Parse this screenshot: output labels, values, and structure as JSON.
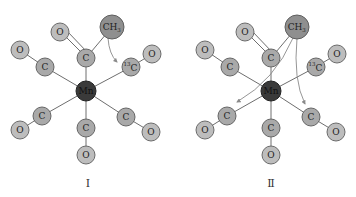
{
  "structures": [
    {
      "id": "I",
      "label": "Ⅰ",
      "metal": "Mn",
      "acyl_carbon": "C",
      "acyl_oxygen": "O",
      "methyl": "CH",
      "methyl_sub": "3",
      "isotope_carbon": "C",
      "isotope_mass": "13",
      "ligand_carbon": "C",
      "ligand_oxygen": "O",
      "arrows": [
        "CH3 migration to 13C"
      ]
    },
    {
      "id": "II",
      "label": "Ⅱ",
      "metal": "Mn",
      "acyl_carbon": "C",
      "acyl_oxygen": "O",
      "methyl": "CH",
      "methyl_sub": "3",
      "isotope_carbon": "C",
      "isotope_mass": "13",
      "ligand_carbon": "C",
      "ligand_oxygen": "O",
      "arrows": [
        "CH3 migration to lower-left CO",
        "CH3 migration to lower-right CO"
      ]
    }
  ],
  "colors": {
    "oxygen": "#bdbdbd",
    "carbon": "#a9a9a9",
    "manganese": "#3a3a3a",
    "methyl": "#8f8f8f",
    "bond": "#6e6e6e"
  }
}
